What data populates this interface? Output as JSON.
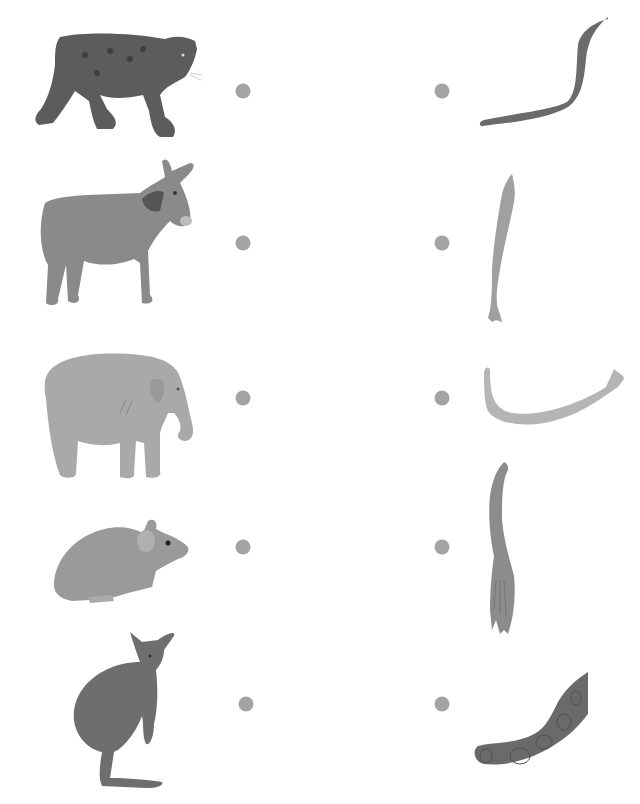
{
  "worksheet": {
    "type": "match-animal-to-tail",
    "rows": [
      {
        "animal": "jaguar",
        "tail": "jaguar-tail",
        "animal_color": "#5c5c5c",
        "tail_color": "#6b6b6b"
      },
      {
        "animal": "donkey",
        "tail": "donkey-tail",
        "animal_color": "#8a8a8a",
        "tail_color": "#a0a0a0"
      },
      {
        "animal": "elephant",
        "tail": "elephant-tail",
        "animal_color": "#a9a9a9",
        "tail_color": "#b5b5b5"
      },
      {
        "animal": "mouse",
        "tail": "mouse-tail",
        "animal_color": "#9a9a9a",
        "tail_color": "#8c8c8c"
      },
      {
        "animal": "kangaroo",
        "tail": "kangaroo-tail",
        "animal_color": "#6e6e6e",
        "tail_color": "#6a6a6a"
      }
    ],
    "dot_color": "#a3a3a3"
  }
}
